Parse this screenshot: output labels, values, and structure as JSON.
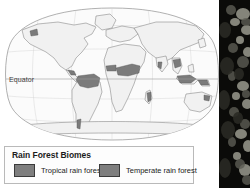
{
  "figure": {
    "map": {
      "projection_label": "robinson-world-map",
      "equator_label": "Equator",
      "shaded_regions": [
        "Amazon basin",
        "Central America",
        "Congo basin",
        "West Africa",
        "Madagascar",
        "Southeast Asia",
        "Indonesia",
        "New Guinea",
        "Pacific Northwest",
        "Southern Chile"
      ]
    },
    "legend": {
      "title": "Rain Forest Biomes",
      "entries": [
        {
          "label": "Tropical rain forest",
          "color": "#7e7e7e"
        },
        {
          "label": "Temperate rain forest",
          "color": "#7e7e7e"
        }
      ]
    },
    "photo": {
      "caption_alt": "rain-forest-foliage-photo"
    },
    "colors": {
      "land_fill": "#f2f2f2",
      "ocean_fill": "#fbfbfb",
      "outline": "#8c8c8c",
      "shade": "#7e7e7e",
      "legend_border": "#b9b9b9",
      "text": "#1c1c1c"
    }
  }
}
